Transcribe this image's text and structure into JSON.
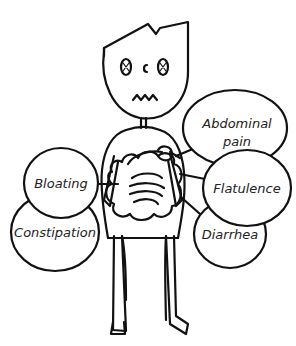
{
  "figure": {
    "colors": {
      "line": "#111111",
      "text": "#222222",
      "background": "#ffffff"
    }
  },
  "symptoms": [
    {
      "id": "abdominal-pain",
      "label_line1": "Abdominal",
      "label_line2": "pain"
    },
    {
      "id": "flatulence",
      "label_line1": "Flatulence"
    },
    {
      "id": "bloating",
      "label_line1": "Bloating"
    },
    {
      "id": "constipation",
      "label_line1": "Constipation"
    },
    {
      "id": "diarrhea",
      "label_line1": "Diarrhea"
    }
  ]
}
